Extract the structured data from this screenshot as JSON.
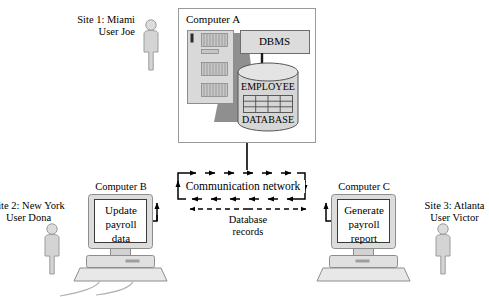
{
  "diagram": {
    "sites": [
      {
        "id": "site1",
        "label": "Site 1: Miami\nUser Joe",
        "person_icon": "person-icon"
      },
      {
        "id": "site2",
        "label": "Site 2: New York\nUser Dona",
        "person_icon": "person-icon"
      },
      {
        "id": "site3",
        "label": "Site 3: Atlanta\nUser Victor",
        "person_icon": "person-icon"
      }
    ],
    "computer_a": {
      "title": "Computer A",
      "dbms_label": "DBMS",
      "cylinder_top_label": "EMPLOYEE",
      "cylinder_bottom_label": "DATABASE",
      "server_icon": "server-tower-icon",
      "cylinder_icon": "database-cylinder-icon"
    },
    "computer_b": {
      "title": "Computer B",
      "screen_text": "Update\npayroll\ndata",
      "monitor_icon": "desktop-monitor-icon"
    },
    "computer_c": {
      "title": "Computer C",
      "screen_text": "Generate\npayroll\nreport",
      "monitor_icon": "desktop-monitor-icon"
    },
    "network": {
      "label": "Communication network",
      "flow_label": "Database\nrecords",
      "top_arrow_count": 6,
      "bottom_arrow_count": 6,
      "dashed_arrow": "bidirectional"
    },
    "colors": {
      "line": "#000000",
      "box_border": "#9a9a9a",
      "person_fill": "#d2d2d2",
      "person_stroke": "#9a9a9a",
      "server_fill": "#d8d8d8",
      "server_shadow": "#8c8c8c",
      "cylinder_fill": "#d4d4d4",
      "dbms_fill": "#d9d9d9",
      "monitor_fill": "#d9d9d9",
      "monitor_screen": "#ffffff",
      "background": "#ffffff"
    }
  }
}
